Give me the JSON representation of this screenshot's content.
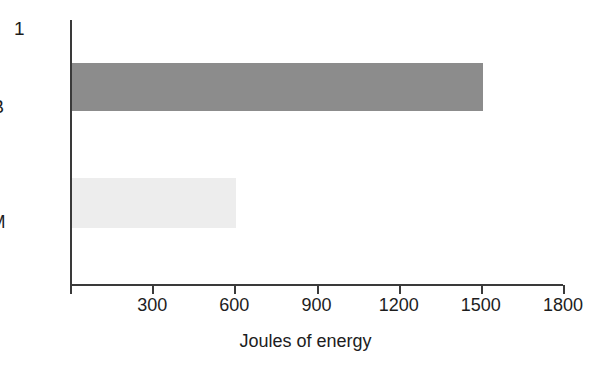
{
  "figure": {
    "number_label": "1"
  },
  "chart_data": {
    "type": "bar",
    "orientation": "horizontal",
    "title": "",
    "xlabel": "Joules of energy",
    "ylabel": "",
    "categories": [
      "B",
      "M"
    ],
    "values": [
      1500,
      600
    ],
    "series": [
      {
        "name": "Joules of energy",
        "values": [
          1500,
          600
        ]
      }
    ],
    "bars": [
      {
        "category": "B",
        "value": 1500,
        "color": "#8c8c8c"
      },
      {
        "category": "M",
        "value": 600,
        "color": "#ededed"
      }
    ],
    "xlim": [
      0,
      1800
    ],
    "ylim": null,
    "xticks": [
      0,
      300,
      600,
      900,
      1200,
      1500,
      1800
    ],
    "xtick_labels": [
      "",
      "300",
      "600",
      "900",
      "1200",
      "1500",
      "1800"
    ],
    "grid": false,
    "legend": null,
    "axis_color": "#3a3a3a"
  }
}
